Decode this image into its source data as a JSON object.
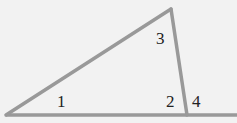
{
  "diagram": {
    "type": "triangle-with-exterior-angle",
    "colors": {
      "background": "#f2f2f2",
      "stroke": "#999999",
      "text": "#222222"
    },
    "vertices": {
      "left": [
        6,
        115
      ],
      "top": [
        171,
        9
      ],
      "bottom_right": [
        187,
        115
      ]
    },
    "base_extension_end": [
      237,
      115
    ],
    "angle_labels": [
      {
        "id": "angle-1",
        "text": "1",
        "x": 57,
        "y": 107
      },
      {
        "id": "angle-3",
        "text": "3",
        "x": 156,
        "y": 44
      },
      {
        "id": "angle-2",
        "text": "2",
        "x": 166,
        "y": 107
      },
      {
        "id": "angle-4",
        "text": "4",
        "x": 192,
        "y": 107
      }
    ]
  }
}
